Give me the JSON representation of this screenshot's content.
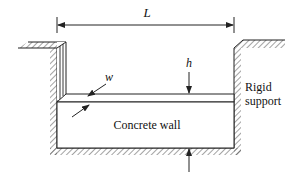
{
  "diagram": {
    "type": "engineering-schematic",
    "labels": {
      "length": "L",
      "height": "h",
      "width": "w",
      "wall": "Concrete wall",
      "support_line1": "Rigid",
      "support_line2": "support"
    },
    "colors": {
      "line": "#222222",
      "hatch": "#555555",
      "background": "#ffffff"
    }
  }
}
